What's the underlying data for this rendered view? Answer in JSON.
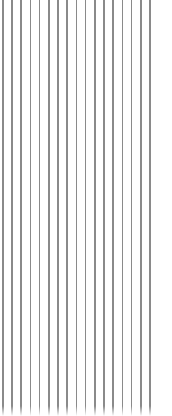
{
  "canvas": {
    "width": 172,
    "height": 416,
    "background_color": "#ffffff"
  },
  "pattern": {
    "kind": "vertical-line-pattern",
    "orientation": "vertical",
    "line_count": 17,
    "first_line_x": 2,
    "spacing_px": 9.2,
    "line_width_px": 1.5,
    "line_color": "#8a8a8a",
    "line_top_y": 0,
    "line_bottom_y": 416,
    "right_margin_px": 16
  },
  "bottom_fade": {
    "enabled": true,
    "start_y": 406,
    "end_y": 416,
    "height_px": 10,
    "fade_to_color": "#ffffff"
  }
}
